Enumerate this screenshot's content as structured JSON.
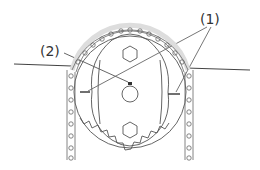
{
  "diagram": {
    "labels": [
      {
        "id": "1",
        "text": "(1)",
        "meaning": "alignment marks on sprocket"
      },
      {
        "id": "2",
        "text": "(2)",
        "meaning": "key / notch mark at hub"
      }
    ],
    "colors": {
      "line": "#444444",
      "background": "#ffffff"
    }
  }
}
